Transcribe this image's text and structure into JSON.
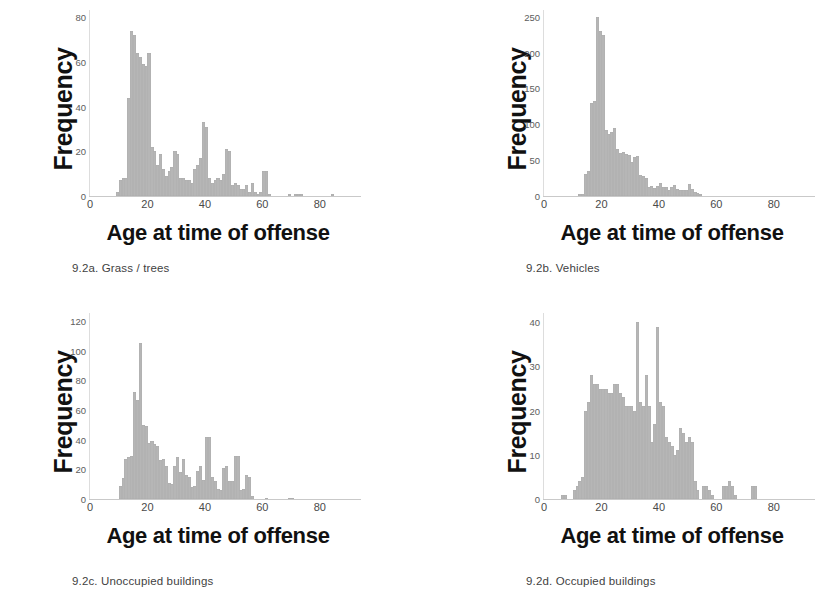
{
  "figure": {
    "background_color": "#ffffff",
    "bar_color": "#b6b6b6",
    "axis_label_color": "#111111",
    "tick_color": "#4a4a4a"
  },
  "common": {
    "xlabel": "Age at time of offense",
    "ylabel": "Frequency",
    "xticks": [
      "0",
      "20",
      "40",
      "60",
      "80"
    ]
  },
  "panels": [
    {
      "caption": "9.2a. Grass / trees",
      "yticks": [
        "0",
        "20",
        "40",
        "60",
        "80"
      ]
    },
    {
      "caption": "9.2b. Vehicles",
      "yticks": [
        "0",
        "50",
        "100",
        "150",
        "200",
        "250"
      ]
    },
    {
      "caption": "9.2c. Unoccupied buildings",
      "yticks": [
        "0",
        "20",
        "40",
        "60",
        "80",
        "100",
        "120"
      ]
    },
    {
      "caption": "9.2d. Occupied buildings",
      "yticks": [
        "0",
        "10",
        "20",
        "30",
        "40"
      ]
    }
  ],
  "chart_data": [
    {
      "type": "bar",
      "title": "9.2a. Grass / trees",
      "xlabel": "Age at time of offense",
      "ylabel": "Frequency",
      "xlim": [
        0,
        94
      ],
      "ylim": [
        0,
        85
      ],
      "xticks": [
        0,
        20,
        40,
        60,
        80
      ],
      "yticks": [
        0,
        20,
        40,
        60,
        80
      ],
      "grid": false,
      "legend": null,
      "bin_width": 1,
      "x": [
        9,
        10,
        11,
        12,
        13,
        14,
        15,
        16,
        17,
        18,
        19,
        20,
        21,
        22,
        23,
        24,
        25,
        26,
        27,
        28,
        29,
        30,
        31,
        32,
        33,
        34,
        35,
        36,
        37,
        38,
        39,
        40,
        41,
        42,
        43,
        44,
        45,
        46,
        47,
        48,
        49,
        50,
        51,
        52,
        53,
        54,
        55,
        56,
        57,
        58,
        59,
        60,
        61,
        62,
        63,
        64,
        65,
        66,
        67,
        68,
        69,
        70,
        71,
        72,
        73,
        74,
        75,
        76,
        77,
        78,
        79,
        80,
        81,
        82,
        83,
        84
      ],
      "values": [
        2,
        7,
        8,
        8,
        44,
        74,
        72,
        64,
        62,
        59,
        58,
        64,
        22,
        20,
        14,
        19,
        12,
        9,
        11,
        13,
        20,
        19,
        8,
        8,
        7,
        7,
        6,
        12,
        14,
        17,
        33,
        31,
        8,
        6,
        7,
        8,
        7,
        10,
        21,
        20,
        5,
        6,
        5,
        3,
        3,
        5,
        2,
        6,
        2,
        1,
        2,
        11,
        11,
        1,
        0,
        0,
        0,
        0,
        0,
        0,
        1,
        0,
        1,
        1,
        1,
        0,
        0,
        0,
        0,
        0,
        0,
        0,
        0,
        0,
        0,
        1
      ]
    },
    {
      "type": "bar",
      "title": "9.2b. Vehicles",
      "xlabel": "Age at time of offense",
      "ylabel": "Frequency",
      "xlim": [
        0,
        94
      ],
      "ylim": [
        0,
        265
      ],
      "xticks": [
        0,
        20,
        40,
        60,
        80
      ],
      "yticks": [
        0,
        50,
        100,
        150,
        200,
        250
      ],
      "grid": false,
      "legend": null,
      "bin_width": 1,
      "x": [
        12,
        13,
        14,
        15,
        16,
        17,
        18,
        19,
        20,
        21,
        22,
        23,
        24,
        25,
        26,
        27,
        28,
        29,
        30,
        31,
        32,
        33,
        34,
        35,
        36,
        37,
        38,
        39,
        40,
        41,
        42,
        43,
        44,
        45,
        46,
        47,
        48,
        49,
        50,
        51,
        52,
        53,
        54
      ],
      "values": [
        3,
        3,
        31,
        35,
        130,
        133,
        250,
        230,
        225,
        92,
        86,
        89,
        95,
        65,
        60,
        61,
        58,
        57,
        48,
        55,
        56,
        30,
        28,
        25,
        13,
        14,
        11,
        14,
        18,
        13,
        12,
        9,
        12,
        16,
        10,
        9,
        8,
        8,
        17,
        10,
        6,
        4,
        3
      ]
    },
    {
      "type": "bar",
      "title": "9.2c. Unoccupied buildings",
      "xlabel": "Age at time of offense",
      "ylabel": "Frequency",
      "xlim": [
        0,
        94
      ],
      "ylim": [
        0,
        128
      ],
      "xticks": [
        0,
        20,
        40,
        60,
        80
      ],
      "yticks": [
        0,
        20,
        40,
        60,
        80,
        100,
        120
      ],
      "grid": false,
      "legend": null,
      "bin_width": 1,
      "x": [
        10,
        11,
        12,
        13,
        14,
        15,
        16,
        17,
        18,
        19,
        20,
        21,
        22,
        23,
        24,
        25,
        26,
        27,
        28,
        29,
        30,
        31,
        32,
        33,
        34,
        35,
        36,
        37,
        38,
        39,
        40,
        41,
        42,
        43,
        44,
        45,
        46,
        47,
        48,
        49,
        50,
        51,
        52,
        53,
        54,
        55,
        56,
        61,
        69,
        70
      ],
      "values": [
        9,
        14,
        27,
        28,
        29,
        72,
        67,
        105,
        50,
        49,
        38,
        39,
        37,
        36,
        26,
        27,
        22,
        11,
        10,
        22,
        28,
        18,
        27,
        16,
        15,
        8,
        9,
        19,
        22,
        13,
        42,
        42,
        15,
        12,
        7,
        6,
        21,
        22,
        12,
        12,
        29,
        29,
        6,
        7,
        16,
        15,
        2,
        1,
        1,
        1
      ]
    },
    {
      "type": "bar",
      "title": "9.2d. Occupied buildings",
      "xlabel": "Age at time of offense",
      "ylabel": "Frequency",
      "xlim": [
        0,
        94
      ],
      "ylim": [
        0,
        43
      ],
      "xticks": [
        0,
        20,
        40,
        60,
        80
      ],
      "yticks": [
        0,
        10,
        20,
        30,
        40
      ],
      "grid": false,
      "legend": null,
      "bin_width": 1,
      "x": [
        6,
        7,
        10,
        11,
        12,
        13,
        14,
        15,
        16,
        17,
        18,
        19,
        20,
        21,
        22,
        23,
        24,
        25,
        26,
        27,
        28,
        29,
        30,
        31,
        32,
        33,
        34,
        35,
        36,
        37,
        38,
        39,
        40,
        41,
        42,
        43,
        44,
        45,
        46,
        47,
        48,
        49,
        50,
        51,
        52,
        53,
        55,
        56,
        57,
        58,
        62,
        63,
        64,
        65,
        66,
        72,
        73
      ],
      "values": [
        1,
        1,
        2,
        3,
        4,
        5,
        20,
        22,
        28,
        26,
        26,
        25,
        25,
        25,
        24,
        24,
        26,
        26,
        24,
        23,
        21,
        21,
        21,
        20,
        40,
        22,
        21,
        28,
        21,
        13,
        17,
        39,
        22,
        21,
        14,
        13,
        12,
        10,
        11,
        16,
        15,
        13,
        14,
        13,
        4,
        2,
        3,
        3,
        2,
        1,
        3,
        3,
        4,
        3,
        1,
        3,
        3
      ]
    }
  ]
}
